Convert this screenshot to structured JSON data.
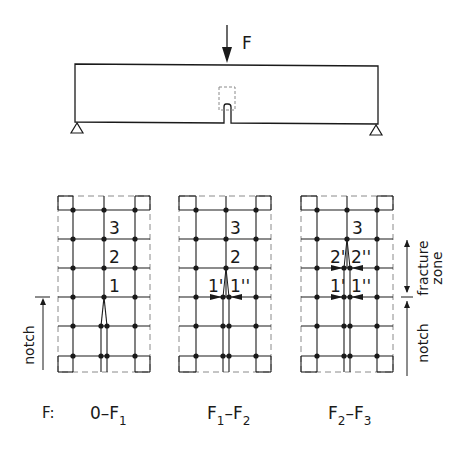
{
  "figure": {
    "beam": {
      "load_label": "F",
      "x": 75,
      "y": 63,
      "width": 303,
      "height": 60,
      "load_x": 227,
      "notch_x": 227,
      "supports": [
        {
          "x": 77
        },
        {
          "x": 376
        }
      ]
    },
    "grid_geometry": {
      "row_y": [
        210,
        239,
        268,
        297,
        326,
        356
      ],
      "top": 196,
      "bottom": 372
    },
    "stages": [
      {
        "id": "stage-1",
        "left": 58,
        "right": 150,
        "col_x": [
          73,
          104,
          135
        ],
        "range_label": {
          "base": "0",
          "dash": "–",
          "f_a": "",
          "sub_a": "",
          "f_b": "F",
          "sub_b": "1"
        },
        "point_labels": [
          {
            "text": "3",
            "x": 109,
            "y": 239
          },
          {
            "text": "2",
            "x": 109,
            "y": 268
          },
          {
            "text": "1",
            "x": 109,
            "y": 297
          }
        ]
      },
      {
        "id": "stage-2",
        "left": 179,
        "right": 271,
        "col_x": [
          196,
          226,
          256
        ],
        "range_label": {
          "base": "",
          "dash": "–",
          "f_a": "F",
          "sub_a": "1",
          "f_b": "F",
          "sub_b": "2"
        },
        "point_labels": [
          {
            "text": "3",
            "x": 230,
            "y": 239
          },
          {
            "text": "2",
            "x": 230,
            "y": 268
          },
          {
            "text": "1'",
            "x": 208,
            "y": 297
          },
          {
            "text": "1''",
            "x": 230,
            "y": 297
          }
        ]
      },
      {
        "id": "stage-3",
        "left": 301,
        "right": 393,
        "col_x": [
          317,
          347,
          377
        ],
        "range_label": {
          "base": "",
          "dash": "–",
          "f_a": "F",
          "sub_a": "2",
          "f_b": "F",
          "sub_b": "3"
        },
        "point_labels": [
          {
            "text": "3",
            "x": 352,
            "y": 239
          },
          {
            "text": "2'",
            "x": 330,
            "y": 268
          },
          {
            "text": "2''",
            "x": 351,
            "y": 268
          },
          {
            "text": "1'",
            "x": 330,
            "y": 297
          },
          {
            "text": "1''",
            "x": 351,
            "y": 297
          }
        ]
      }
    ],
    "left_dimension": {
      "label": "notch"
    },
    "right_dimension": {
      "fracture_label_1": "fracture",
      "fracture_label_2": "zone",
      "notch_label": "notch"
    },
    "footer": {
      "prefix": "F:"
    },
    "colors": {
      "ink": "#1a1a1a",
      "dashed": "#8a8a8a",
      "background": "#ffffff"
    }
  }
}
